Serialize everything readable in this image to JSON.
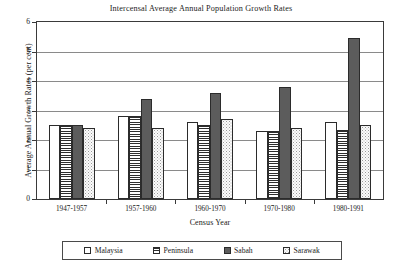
{
  "chart_data": {
    "type": "bar",
    "title": "Intercensal Average Annual Population Growth Rates",
    "xlabel": "Census Year",
    "ylabel": "Average Annual Growth Rates (per cent)",
    "categories": [
      "1947-1957",
      "1957-1960",
      "1960-1970",
      "1970-1980",
      "1980-1991"
    ],
    "series": [
      {
        "name": "Malaysia",
        "values": [
          2.5,
          2.8,
          2.6,
          2.3,
          2.6
        ],
        "color": "#ffffff",
        "pattern": "solid-white"
      },
      {
        "name": "Peninsula",
        "values": [
          2.5,
          2.8,
          2.5,
          2.3,
          2.35
        ],
        "color": "#2e2e2e",
        "pattern": "horizontal-stripes"
      },
      {
        "name": "Sabah",
        "values": [
          2.5,
          3.4,
          3.6,
          3.8,
          5.45
        ],
        "color": "#5c5c5c",
        "pattern": "solid-dark-gray"
      },
      {
        "name": "Sarawak",
        "values": [
          2.4,
          2.4,
          2.7,
          2.4,
          2.5
        ],
        "color": "#fbfbfb",
        "pattern": "speckled-light"
      }
    ],
    "ylim": [
      0,
      6
    ],
    "yticks": [
      0,
      1,
      2,
      3,
      4,
      5,
      6
    ],
    "ytick_labels": [
      "0",
      "1",
      "2",
      "3",
      "4",
      "5",
      "6"
    ],
    "grid": "horizontal",
    "legend_position": "below-axis",
    "frame": true
  }
}
